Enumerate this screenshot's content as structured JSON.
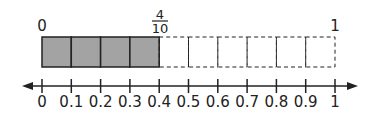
{
  "diagram": {
    "type": "fraction-bar-with-number-line",
    "bar": {
      "start_label": "0",
      "end_label": "1",
      "shaded_fraction": {
        "numerator": "4",
        "denominator": "10"
      },
      "total_parts": 10,
      "shaded_parts": 4,
      "shaded_color": "#a3a3a3"
    },
    "number_line": {
      "tick_labels": [
        "0",
        "0.1",
        "0.2",
        "0.3",
        "0.4",
        "0.5",
        "0.6",
        "0.7",
        "0.8",
        "0.9",
        "1"
      ],
      "arrows": "both"
    }
  }
}
